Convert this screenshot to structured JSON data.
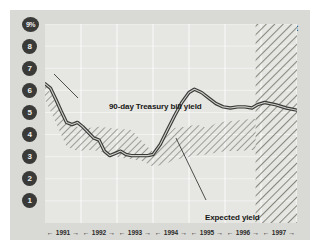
{
  "chart_data": {
    "type": "line",
    "title": "",
    "subtitle": "",
    "xlabel": "",
    "ylabel": "",
    "ylim": [
      0,
      9
    ],
    "xlim": [
      1991,
      1998
    ],
    "grid": true,
    "legend_position": "inline-annotations",
    "y_ticks": [
      "9%",
      "8",
      "7",
      "6",
      "5",
      "4",
      "3",
      "2",
      "1"
    ],
    "y_tick_values": [
      9,
      8,
      7,
      6,
      5,
      4,
      3,
      2,
      1
    ],
    "x_ticks": [
      "1991",
      "1992",
      "1993",
      "1994",
      "1995",
      "1996",
      "1997"
    ],
    "forecast_start": 1996.85,
    "forecast_label": "Forecast",
    "annotations": [
      {
        "text": "90-day Treasury bill yield",
        "x": 1991.5,
        "y": 7.2
      },
      {
        "text": "Expected yield",
        "x": 1994.3,
        "y": 1.8
      }
    ],
    "series": [
      {
        "name": "90-day Treasury bill yield",
        "type": "line",
        "x": [
          1991.0,
          1991.15,
          1991.3,
          1991.45,
          1991.6,
          1991.75,
          1991.9,
          1992.05,
          1992.2,
          1992.35,
          1992.5,
          1992.65,
          1992.8,
          1992.95,
          1993.1,
          1993.25,
          1993.4,
          1993.55,
          1993.7,
          1993.85,
          1994.0,
          1994.2,
          1994.4,
          1994.6,
          1994.8,
          1995.0,
          1995.15,
          1995.35,
          1995.55,
          1995.75,
          1995.95,
          1996.15,
          1996.35,
          1996.55,
          1996.75,
          1996.9,
          1997.1,
          1997.4,
          1997.7,
          1998.0
        ],
        "values": [
          6.3,
          6.1,
          5.6,
          5.05,
          4.55,
          4.45,
          4.55,
          4.35,
          4.1,
          3.85,
          3.75,
          3.25,
          3.05,
          3.15,
          3.25,
          3.1,
          3.05,
          3.05,
          3.05,
          3.05,
          3.1,
          3.55,
          4.2,
          4.85,
          5.45,
          5.9,
          6.05,
          5.9,
          5.65,
          5.4,
          5.25,
          5.2,
          5.25,
          5.25,
          5.2,
          5.35,
          5.45,
          5.35,
          5.2,
          5.1
        ]
      },
      {
        "name": "Expected yield",
        "type": "band",
        "x": [
          1991.0,
          1991.3,
          1991.6,
          1991.9,
          1992.2,
          1992.5,
          1992.8,
          1993.1,
          1993.4,
          1993.7,
          1994.0,
          1994.3,
          1994.6,
          1994.9,
          1995.2,
          1995.5,
          1995.8,
          1996.1,
          1996.4,
          1996.7,
          1996.85
        ],
        "upper": [
          6.3,
          5.45,
          4.6,
          4.35,
          4.3,
          4.35,
          4.3,
          4.25,
          4.2,
          3.7,
          3.2,
          3.8,
          4.3,
          4.35,
          4.45,
          4.3,
          4.55,
          4.6,
          4.65,
          4.7,
          4.7
        ],
        "lower": [
          5.6,
          4.55,
          3.45,
          3.25,
          3.3,
          3.25,
          3.05,
          2.95,
          2.9,
          2.8,
          2.55,
          2.65,
          2.85,
          2.95,
          3.05,
          3.1,
          3.2,
          3.25,
          3.25,
          3.3,
          3.3
        ]
      }
    ]
  },
  "axis": {
    "y_labels": [
      {
        "text": "9%",
        "value": 9
      },
      {
        "text": "8",
        "value": 8
      },
      {
        "text": "7",
        "value": 7
      },
      {
        "text": "6",
        "value": 6
      },
      {
        "text": "5",
        "value": 5
      },
      {
        "text": "4",
        "value": 4
      },
      {
        "text": "3",
        "value": 3
      },
      {
        "text": "2",
        "value": 2
      },
      {
        "text": "1",
        "value": 1
      }
    ],
    "x_labels": [
      {
        "text": "1991"
      },
      {
        "text": "1992"
      },
      {
        "text": "1993"
      },
      {
        "text": "1994"
      },
      {
        "text": "1995"
      },
      {
        "text": "1996"
      },
      {
        "text": "1997"
      }
    ],
    "arrow_left": "←",
    "arrow_right": "→"
  },
  "labels": {
    "forecast": "Forecast",
    "tbill_annotation": "90-day Treasury bill yield",
    "expected_annotation": "Expected yield"
  },
  "colors": {
    "panel_bg": "#d9d9d6",
    "plot_bg": "#e6e6e3",
    "line": "#3a3a38",
    "hatch": "#8d8d89",
    "tick_badge": "#3a3a38",
    "tick_text": "#f0f0ee",
    "forecast_band": "#b9b9b5"
  }
}
